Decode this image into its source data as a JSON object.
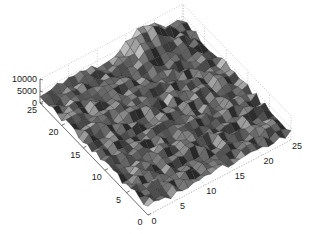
{
  "chart_data": {
    "type": "surface",
    "title": "",
    "xlabel": "",
    "ylabel": "",
    "zlabel": "",
    "grid": true,
    "colormap": "gray",
    "grid_size": [
      25,
      25
    ],
    "x_ticks": [
      "0",
      "5",
      "10",
      "15",
      "20",
      "25"
    ],
    "y_ticks": [
      "0",
      "5",
      "10",
      "15",
      "20",
      "25"
    ],
    "z_ticks": [
      "0",
      "5000",
      "10000"
    ],
    "xlim": [
      0,
      25
    ],
    "ylim": [
      0,
      25
    ],
    "zlim": [
      0,
      10000
    ],
    "surface_description": "Rough random terrain of 25x25 points with values mostly in the 0–6000 range, with a peak near x≈18, y≈25 reaching ≈10000",
    "peak": {
      "x": 18,
      "y": 25,
      "z": 10000
    }
  },
  "projection": {
    "origin": [
      148,
      215
    ],
    "x_end": [
      291,
      140
    ],
    "y_end": [
      40,
      103
    ],
    "z_per_unit": 0.0024
  },
  "colors": {
    "axis": "#555555",
    "grid": "#b0b0b0",
    "edge": "#2a2a2a",
    "background": "#ffffff"
  }
}
